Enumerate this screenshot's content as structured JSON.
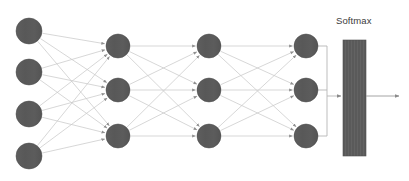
{
  "diagram": {
    "type": "neural-network",
    "title": "",
    "background_color": "#ffffff",
    "node_color": "#595959",
    "node_stroke_color": "#4a4a4a",
    "edge_color": "#c9c9c9",
    "bracket_color": "#b5b5b5",
    "arrow_color": "#9a9a9a",
    "softmax_bar_color": "#5a5a5a",
    "label_color": "#3b3b3b",
    "softmax": {
      "label": "Softmax",
      "bar": {
        "x": 343,
        "y": 40,
        "width": 23,
        "height": 116
      },
      "label_x": 336,
      "label_y": 16
    },
    "output_arrow": {
      "x1": 366,
      "y1": 96,
      "x2": 399,
      "y2": 96
    },
    "bracket": {
      "join_x": 327,
      "tip_x": 341,
      "tip_y": 96
    },
    "layers": [
      {
        "name": "input-layer",
        "radius": 13,
        "nodes": [
          {
            "label": "",
            "cx": 29,
            "cy": 31
          },
          {
            "label": "",
            "cx": 29,
            "cy": 72
          },
          {
            "label": "",
            "cx": 29,
            "cy": 114
          },
          {
            "label": "",
            "cx": 29,
            "cy": 156
          }
        ]
      },
      {
        "name": "hidden-layer-1",
        "radius": 12,
        "nodes": [
          {
            "label": "",
            "cx": 118,
            "cy": 46
          },
          {
            "label": "",
            "cx": 118,
            "cy": 90
          },
          {
            "label": "",
            "cx": 118,
            "cy": 136
          }
        ]
      },
      {
        "name": "hidden-layer-2",
        "radius": 12,
        "nodes": [
          {
            "label": "",
            "cx": 209,
            "cy": 46
          },
          {
            "label": "",
            "cx": 209,
            "cy": 90
          },
          {
            "label": "",
            "cx": 209,
            "cy": 136
          }
        ]
      },
      {
        "name": "output-layer",
        "radius": 12,
        "nodes": [
          {
            "label": "",
            "cx": 306,
            "cy": 46
          },
          {
            "label": "",
            "cx": 306,
            "cy": 90
          },
          {
            "label": "",
            "cx": 306,
            "cy": 136
          }
        ]
      }
    ]
  }
}
